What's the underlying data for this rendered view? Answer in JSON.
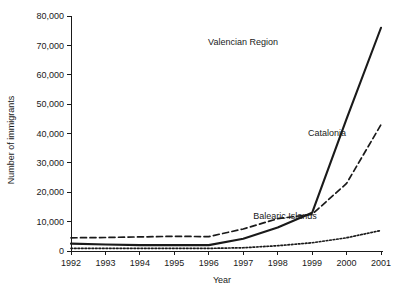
{
  "chart_data": {
    "type": "line",
    "title": "",
    "xlabel": "Year",
    "ylabel": "Number of immigrants",
    "x": [
      1992,
      1993,
      1994,
      1995,
      1996,
      1997,
      1998,
      1999,
      2000,
      2001
    ],
    "xtick_labels": [
      "1992",
      "1993",
      "1994",
      "1995",
      "1996",
      "1997",
      "1998",
      "1999",
      "2000",
      "2001"
    ],
    "ytick_labels": [
      "0",
      "10,000",
      "20,000",
      "30,000",
      "40,000",
      "50,000",
      "60,000",
      "70,000",
      "80,000"
    ],
    "yticks": [
      0,
      10000,
      20000,
      30000,
      40000,
      50000,
      60000,
      70000,
      80000
    ],
    "ylim": [
      0,
      80000
    ],
    "xlim": [
      1992,
      2001
    ],
    "grid": false,
    "legend_position": "inline-annotations",
    "series": [
      {
        "name": "Valencian Region",
        "style": "solid",
        "label_x": 2000,
        "values": [
          2500,
          2200,
          2000,
          2000,
          2000,
          4200,
          8000,
          13000,
          45000,
          76000
        ]
      },
      {
        "name": "Catalonia",
        "style": "dashed",
        "label_x": 2000,
        "values": [
          4500,
          4600,
          4800,
          5000,
          4900,
          7500,
          11000,
          12500,
          23000,
          43000
        ]
      },
      {
        "name": "Balearic Islands",
        "style": "dotted",
        "label_x": 1999,
        "values": [
          900,
          900,
          900,
          900,
          900,
          1100,
          1800,
          2800,
          4500,
          7000
        ]
      }
    ],
    "annotations": [
      {
        "text": "Valencian Region",
        "x": 243,
        "y": 45
      },
      {
        "text": "Catalonia",
        "x": 327,
        "y": 136
      },
      {
        "text": "Balearic Islands",
        "x": 285,
        "y": 219
      }
    ]
  }
}
